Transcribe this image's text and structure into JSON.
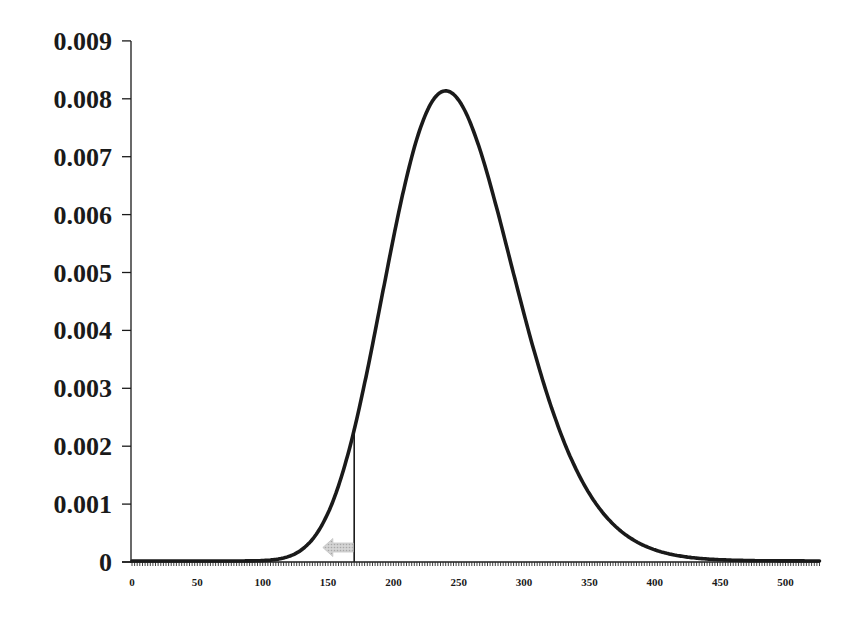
{
  "chart_data": {
    "type": "line",
    "title": "",
    "xlabel": "",
    "ylabel": "",
    "xlim": [
      0,
      526
    ],
    "ylim": [
      0,
      0.009
    ],
    "grid": false,
    "legend": null,
    "x_ticks": [
      0,
      50,
      100,
      150,
      200,
      250,
      300,
      350,
      400,
      450,
      500
    ],
    "x_tick_labels": [
      "0",
      "50",
      "100",
      "150",
      "200",
      "250",
      "300",
      "350",
      "400",
      "450",
      "500"
    ],
    "x_minor_tick_step": 2,
    "y_ticks": [
      0,
      0.001,
      0.002,
      0.003,
      0.004,
      0.005,
      0.006,
      0.007,
      0.008,
      0.009
    ],
    "y_tick_labels": [
      "0",
      "0.001",
      "0.002",
      "0.003",
      "0.004",
      "0.005",
      "0.006",
      "0.007",
      "0.008",
      "0.009"
    ],
    "series": [
      {
        "name": "probability density",
        "distribution": "gamma-like (right-skewed)",
        "shape_k": 25,
        "scale_theta": 10,
        "mode": 240,
        "peak_value": 0.00812,
        "color": "#1a1a1a",
        "x": [
          0,
          100,
          120,
          140,
          150,
          170,
          190,
          210,
          230,
          240,
          250,
          270,
          297,
          335,
          360,
          396,
          435,
          480,
          526
        ],
        "values": [
          0,
          2e-05,
          0.00012,
          0.00048,
          0.00082,
          0.00227,
          0.00452,
          0.0066,
          0.008,
          0.00812,
          0.008,
          0.007,
          0.00452,
          0.0019,
          0.00081,
          0.00029,
          9e-05,
          2e-05,
          0
        ]
      }
    ],
    "annotations": [
      {
        "type": "vertical-line",
        "x": 170,
        "y_top": 0.00227,
        "label": "cutoff",
        "color": "#1a1a1a"
      },
      {
        "type": "arrow",
        "direction": "left",
        "x_from": 170,
        "x_to": 146,
        "y": 0.00025,
        "color": "#b8b8b8",
        "fill": "dotted"
      }
    ]
  }
}
